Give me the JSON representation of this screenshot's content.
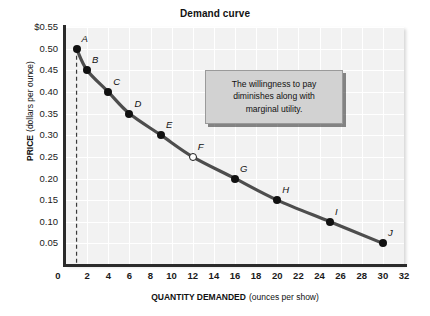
{
  "chart_data": {
    "type": "line",
    "title": "Demand curve",
    "xlabel_bold": "QUANTITY DEMANDED",
    "xlabel_note": "(ounces per show)",
    "ylabel_bold": "PRICE",
    "ylabel_note": "(dollars per ounce)",
    "xlim": [
      0,
      32
    ],
    "ylim": [
      0,
      0.55
    ],
    "grid": true,
    "legend": "none",
    "xticks": [
      "0",
      "2",
      "4",
      "6",
      "8",
      "10",
      "12",
      "14",
      "16",
      "18",
      "20",
      "22",
      "24",
      "26",
      "28",
      "30",
      "32"
    ],
    "xtick_values": [
      0,
      2,
      4,
      6,
      8,
      10,
      12,
      14,
      16,
      18,
      20,
      22,
      24,
      26,
      28,
      30,
      32
    ],
    "yticks": [
      "$0.55",
      "0.50",
      "0.45",
      "0.40",
      "0.35",
      "0.30",
      "0.25",
      "0.20",
      "0.15",
      "0.10",
      "0.05"
    ],
    "ytick_values": [
      0.55,
      0.5,
      0.45,
      0.4,
      0.35,
      0.3,
      0.25,
      0.2,
      0.15,
      0.1,
      0.05
    ],
    "series": [
      {
        "name": "Demand",
        "color": "#4d4d4d",
        "points": [
          {
            "label": "A",
            "x": 1,
            "y": 0.5,
            "marker": "filled"
          },
          {
            "label": "B",
            "x": 2,
            "y": 0.45,
            "marker": "filled"
          },
          {
            "label": "C",
            "x": 4,
            "y": 0.4,
            "marker": "filled"
          },
          {
            "label": "D",
            "x": 6,
            "y": 0.35,
            "marker": "filled"
          },
          {
            "label": "E",
            "x": 9,
            "y": 0.3,
            "marker": "filled"
          },
          {
            "label": "F",
            "x": 12,
            "y": 0.25,
            "marker": "open"
          },
          {
            "label": "G",
            "x": 16,
            "y": 0.2,
            "marker": "filled"
          },
          {
            "label": "H",
            "x": 20,
            "y": 0.15,
            "marker": "filled"
          },
          {
            "label": "I",
            "x": 25,
            "y": 0.1,
            "marker": "filled"
          },
          {
            "label": "J",
            "x": 30,
            "y": 0.05,
            "marker": "filled"
          }
        ]
      }
    ],
    "annotations": [
      {
        "name": "willingness-to-pay-callout",
        "lines": [
          "The willingness to pay",
          "diminishes along with",
          "marginal utility."
        ],
        "background": "#d2d2d2"
      }
    ],
    "reference_lines": [
      {
        "name": "dashed-vertical-at-q1",
        "orientation": "vertical",
        "x": 1,
        "style": "dashed"
      }
    ]
  },
  "colors": {
    "plot_background": "#f2f2f2",
    "gridline": "#ffffff",
    "axis": "#2b2b2b",
    "curve": "#4d4d4d",
    "marker": "#111111",
    "callout_fill": "#d2d2d2"
  }
}
